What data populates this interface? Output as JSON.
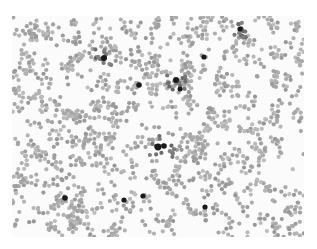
{
  "image": {
    "description": "Grayscale micrograph of densely scattered small round particles with a few dark aggregates",
    "background_color": "#fbfbfb",
    "particle_color": "#a9a9a9",
    "dark_particle_color": "#1a1a1a",
    "particle_radius": 2.1,
    "field": {
      "x": 12,
      "y": 16,
      "width": 292,
      "height": 221
    },
    "dark_spots": [
      {
        "x": 92,
        "y": 42,
        "r": 3.0
      },
      {
        "x": 127,
        "y": 69,
        "r": 2.8
      },
      {
        "x": 164,
        "y": 64,
        "r": 3.0
      },
      {
        "x": 168,
        "y": 73,
        "r": 2.5
      },
      {
        "x": 192,
        "y": 41,
        "r": 2.6
      },
      {
        "x": 228,
        "y": 13,
        "r": 2.6
      },
      {
        "x": 146,
        "y": 131,
        "r": 3.4
      },
      {
        "x": 152,
        "y": 130,
        "r": 2.8
      },
      {
        "x": 53,
        "y": 182,
        "r": 2.8
      },
      {
        "x": 112,
        "y": 184,
        "r": 2.6
      },
      {
        "x": 131,
        "y": 180,
        "r": 2.6
      },
      {
        "x": 193,
        "y": 191,
        "r": 2.6
      }
    ],
    "dark_clusters": [
      {
        "x": 92,
        "y": 40,
        "spread": 9
      },
      {
        "x": 164,
        "y": 66,
        "spread": 10
      },
      {
        "x": 150,
        "y": 128,
        "spread": 14
      },
      {
        "x": 228,
        "y": 14,
        "spread": 8
      }
    ],
    "particle_count": 1500,
    "seed": 7
  }
}
